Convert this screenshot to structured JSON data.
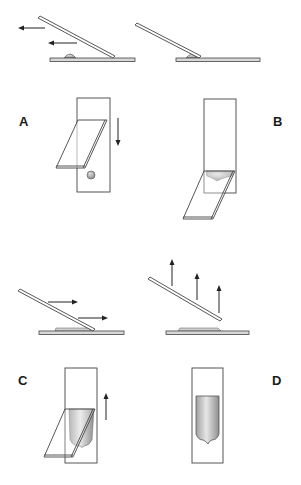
{
  "figure": {
    "panels": [
      {
        "id": "A",
        "label": "A",
        "description": "Spreader slide pulled back into drop"
      },
      {
        "id": "B",
        "label": "B",
        "description": "Drop spreads along edge of spreader"
      },
      {
        "id": "C",
        "label": "C",
        "description": "Spreader pushed forward to form smear"
      },
      {
        "id": "D",
        "label": "D",
        "description": "Finished smear with feathered edge"
      }
    ],
    "colors": {
      "outline": "#444444",
      "smear_light": "#e8e8e8",
      "smear_dark": "#9a9a9a",
      "drop": "#a8a8a8",
      "background": "#ffffff"
    },
    "icons": {
      "arrow_left": "arrow-left-icon",
      "arrow_down": "arrow-down-icon",
      "arrow_right": "arrow-right-icon",
      "arrow_up": "arrow-up-icon"
    }
  }
}
